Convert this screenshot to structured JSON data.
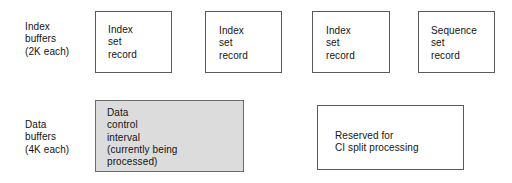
{
  "diagram": {
    "background_color": "#ffffff",
    "border_color": "#5a5a5a",
    "shaded_fill_color": "#dcdcdc",
    "text_color": "#141414",
    "rows": [
      {
        "label": "Index\nbuffers\n(2K each)",
        "label_lines": [
          "Index",
          "buffers",
          "(2K each)"
        ]
      },
      {
        "label": "Data\nbuffers\n(4K each)",
        "label_lines": [
          "Data",
          "buffers",
          "(4K each)"
        ]
      }
    ],
    "index_boxes": [
      {
        "text": "Index\nset\nrecord",
        "shaded": "no"
      },
      {
        "text": "Index\nset\nrecord",
        "shaded": "no"
      },
      {
        "text": "Index\nset\nrecord",
        "shaded": "no"
      },
      {
        "text": "Sequence\nset\nrecord",
        "shaded": "no"
      }
    ],
    "data_boxes": [
      {
        "text": "Data\ncontrol\ninterval\n(currently being\nprocessed)",
        "shaded": "yes"
      },
      {
        "text": "Reserved for\nCI split processing",
        "shaded": "no"
      }
    ]
  }
}
